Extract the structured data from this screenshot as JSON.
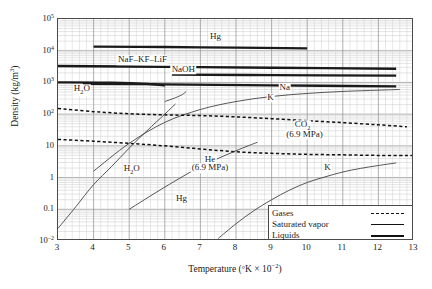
{
  "chart_data": {
    "type": "line",
    "title": "",
    "xlabel": "Temperature (°K × 10⁻²)",
    "ylabel": "Density (kg/m³)",
    "xlim": [
      3,
      13
    ],
    "ylim": [
      0.01,
      100000
    ],
    "yscale": "log",
    "xscale": "linear",
    "grid": true,
    "legend_position": "bottom-right",
    "xticks": [
      "3",
      "4",
      "5",
      "6",
      "7",
      "8",
      "9",
      "10",
      "11",
      "12",
      "13"
    ],
    "yticks": [
      "10⁵",
      "10⁴",
      "10³",
      "10²",
      "10",
      "1",
      "0.1",
      "10⁻²"
    ],
    "ytick_values": [
      100000,
      10000,
      1000,
      100,
      10,
      1,
      0.1,
      0.01
    ],
    "legend": [
      {
        "label": "Gases",
        "style": "dashed"
      },
      {
        "label": "Saturated vapor",
        "style": "thin-solid"
      },
      {
        "label": "Liquids",
        "style": "thick-solid"
      }
    ],
    "series": [
      {
        "name": "Hg liquid",
        "label": "Hg",
        "style": "thick-solid",
        "points": [
          [
            4.0,
            13500
          ],
          [
            6.0,
            13100
          ],
          [
            8.0,
            12500
          ],
          [
            10.0,
            11800
          ]
        ]
      },
      {
        "name": "NaF-KF-LiF liquid",
        "label": "NaF–KF–LiF",
        "style": "thick-solid",
        "points": [
          [
            3.0,
            3300
          ],
          [
            6.0,
            3100
          ],
          [
            9.0,
            2900
          ],
          [
            12.5,
            2700
          ]
        ]
      },
      {
        "name": "NaOH liquid",
        "label": "NaOH",
        "style": "thick-solid",
        "points": [
          [
            6.2,
            1750
          ],
          [
            9.0,
            1700
          ],
          [
            12.5,
            1650
          ]
        ]
      },
      {
        "name": "H2O liquid",
        "label": "H₂O",
        "style": "thick-solid",
        "points": [
          [
            3.0,
            1000
          ],
          [
            4.5,
            980
          ],
          [
            5.5,
            900
          ],
          [
            6.0,
            800
          ]
        ]
      },
      {
        "name": "H2O saturated vapor upper",
        "label": "",
        "style": "thin-solid",
        "points": [
          [
            6.0,
            250
          ],
          [
            6.3,
            330
          ],
          [
            6.5,
            420
          ],
          [
            6.6,
            520
          ]
        ]
      },
      {
        "name": "Na liquid",
        "label": "Na",
        "style": "thick-solid",
        "points": [
          [
            3.7,
            910
          ],
          [
            6.0,
            870
          ],
          [
            9.0,
            810
          ],
          [
            12.5,
            750
          ]
        ]
      },
      {
        "name": "K saturated vapor upper",
        "label": "K",
        "style": "thin-solid",
        "points": [
          [
            4.0,
            1.6
          ],
          [
            5.0,
            12
          ],
          [
            6.0,
            55
          ],
          [
            7.0,
            140
          ],
          [
            8.0,
            250
          ],
          [
            9.0,
            360
          ],
          [
            10.0,
            450
          ],
          [
            11.0,
            520
          ],
          [
            12.0,
            570
          ],
          [
            12.6,
            600
          ]
        ]
      },
      {
        "name": "CO2 gas (6.9 MPa)",
        "label": "CO₂\n(6.9 MPa)",
        "style": "dashed",
        "points": [
          [
            3.0,
            150
          ],
          [
            4.0,
            120
          ],
          [
            5.0,
            103
          ],
          [
            6.0,
            95
          ],
          [
            7.0,
            90
          ],
          [
            8.0,
            82
          ],
          [
            9.0,
            72
          ],
          [
            10.0,
            62
          ],
          [
            11.0,
            54
          ],
          [
            12.0,
            46
          ],
          [
            12.8,
            40
          ]
        ]
      },
      {
        "name": "He gas (6.9 MPa)",
        "label": "He\n(6.9 MPa)",
        "style": "dashed",
        "points": [
          [
            3.0,
            16
          ],
          [
            4.0,
            14
          ],
          [
            5.0,
            12
          ],
          [
            6.0,
            10
          ],
          [
            7.0,
            8
          ],
          [
            8.0,
            6.5
          ],
          [
            9.0,
            5.8
          ],
          [
            10.0,
            5.4
          ],
          [
            11.0,
            5.2
          ],
          [
            12.0,
            5.0
          ],
          [
            13.0,
            5.0
          ]
        ]
      },
      {
        "name": "H2O saturated vapor",
        "label": "H₂O",
        "style": "thin-solid",
        "points": [
          [
            3.0,
            0.025
          ],
          [
            3.5,
            0.12
          ],
          [
            4.0,
            0.6
          ],
          [
            4.5,
            2.2
          ],
          [
            5.0,
            8.5
          ],
          [
            5.5,
            30
          ],
          [
            6.0,
            100
          ],
          [
            6.3,
            210
          ]
        ]
      },
      {
        "name": "Hg saturated vapor",
        "label": "Hg",
        "style": "thin-solid",
        "points": [
          [
            5.0,
            0.1
          ],
          [
            6.0,
            0.5
          ],
          [
            7.0,
            2.2
          ],
          [
            8.0,
            7.0
          ],
          [
            8.6,
            13
          ]
        ]
      },
      {
        "name": "K saturated vapor lower",
        "label": "K",
        "style": "thin-solid",
        "points": [
          [
            7.5,
            0.012
          ],
          [
            8.0,
            0.035
          ],
          [
            8.5,
            0.09
          ],
          [
            9.0,
            0.2
          ],
          [
            9.5,
            0.4
          ],
          [
            10.0,
            0.7
          ],
          [
            10.5,
            1.05
          ],
          [
            11.0,
            1.5
          ],
          [
            11.5,
            1.95
          ],
          [
            12.0,
            2.4
          ],
          [
            12.5,
            2.9
          ]
        ]
      }
    ],
    "annotations": [
      {
        "text": "Hg",
        "x": 7.45,
        "y": 26000
      },
      {
        "text": "NaF–KF–LiF",
        "x": 5.4,
        "y": 4600
      },
      {
        "text": "NaOH",
        "x": 6.55,
        "y": 2300
      },
      {
        "text": "H₂O",
        "x": 3.7,
        "y": 520
      },
      {
        "text": "Na",
        "x": 9.4,
        "y": 600
      },
      {
        "text": "K",
        "x": 9.0,
        "y": 300
      },
      {
        "text": "CO₂",
        "x": 9.9,
        "y": 38
      },
      {
        "text": "(6.9 MPa)",
        "x": 9.95,
        "y": 21
      },
      {
        "text": "He",
        "x": 7.3,
        "y": 3.4
      },
      {
        "text": "(6.9 MPa)",
        "x": 7.3,
        "y": 1.85
      },
      {
        "text": "H₂O",
        "x": 5.1,
        "y": 1.6
      },
      {
        "text": "Hg",
        "x": 6.5,
        "y": 0.19
      },
      {
        "text": "K",
        "x": 10.6,
        "y": 1.9
      }
    ]
  }
}
